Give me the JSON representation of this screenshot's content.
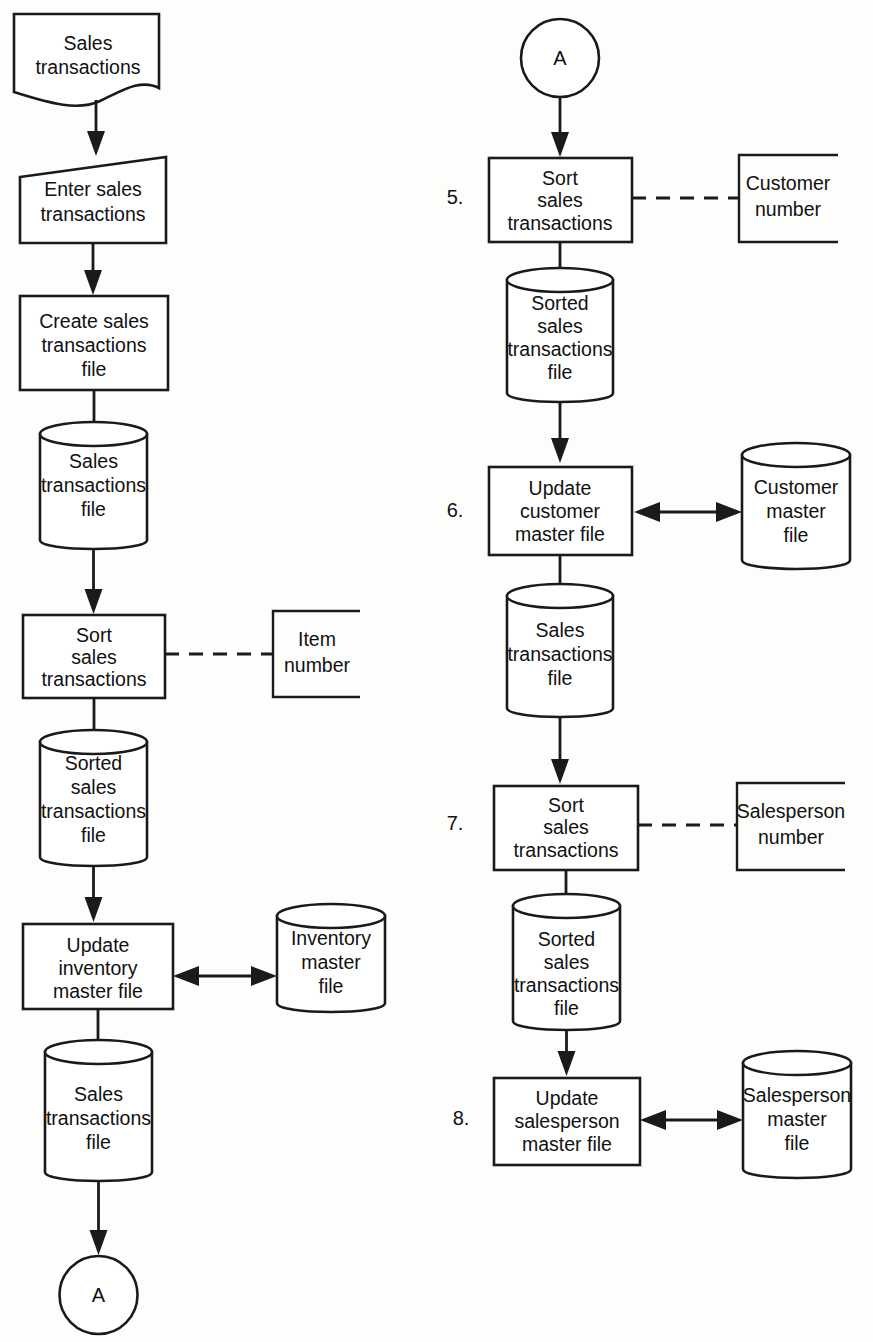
{
  "diagram": {
    "type": "system-flowchart",
    "colors": {
      "stroke": "#1a1a1a",
      "fill": "#ffffff",
      "background": "#fdfdfc",
      "text": "#111111"
    },
    "left_column": {
      "nodes": [
        {
          "id": "doc-sales-transactions",
          "shape": "document",
          "lines": [
            "Sales",
            "transactions"
          ]
        },
        {
          "id": "manual-enter-sales-transactions",
          "shape": "manual-input",
          "lines": [
            "Enter sales",
            "transactions"
          ]
        },
        {
          "id": "process-create-sales-transactions-file",
          "shape": "process",
          "lines": [
            "Create sales",
            "transactions",
            "file"
          ]
        },
        {
          "id": "store-sales-transactions-file-1",
          "shape": "cylinder",
          "lines": [
            "Sales",
            "transactions",
            "file"
          ]
        },
        {
          "id": "process-sort-sales-transactions-item",
          "shape": "process",
          "lines": [
            "Sort",
            "sales",
            "transactions"
          ]
        },
        {
          "id": "store-sorted-sales-transactions-file-1",
          "shape": "cylinder",
          "lines": [
            "Sorted",
            "sales",
            "transactions",
            "file"
          ]
        },
        {
          "id": "process-update-inventory-master-file",
          "shape": "process",
          "lines": [
            "Update",
            "inventory",
            "master file"
          ]
        },
        {
          "id": "store-sales-transactions-file-2",
          "shape": "cylinder",
          "lines": [
            "Sales",
            "transactions",
            "file"
          ]
        },
        {
          "id": "connector-a-out",
          "shape": "circle",
          "lines": [
            "A"
          ]
        }
      ],
      "annotations": [
        {
          "id": "annotation-item-number",
          "shape": "open-box",
          "lines": [
            "Item",
            "number"
          ],
          "attached_to": "process-sort-sales-transactions-item",
          "link": "dashed"
        }
      ],
      "master_files": [
        {
          "id": "store-inventory-master-file",
          "shape": "cylinder",
          "lines": [
            "Inventory",
            "master",
            "file"
          ],
          "link": "double-arrow",
          "linked_to": "process-update-inventory-master-file"
        }
      ]
    },
    "right_column": {
      "nodes": [
        {
          "id": "connector-a-in",
          "shape": "circle",
          "lines": [
            "A"
          ]
        },
        {
          "id": "process-sort-sales-transactions-customer",
          "shape": "process",
          "step": "5.",
          "lines": [
            "Sort",
            "sales",
            "transactions"
          ]
        },
        {
          "id": "store-sorted-sales-transactions-file-2",
          "shape": "cylinder",
          "lines": [
            "Sorted",
            "sales",
            "transactions",
            "file"
          ]
        },
        {
          "id": "process-update-customer-master-file",
          "shape": "process",
          "step": "6.",
          "lines": [
            "Update",
            "customer",
            "master file"
          ]
        },
        {
          "id": "store-sales-transactions-file-3",
          "shape": "cylinder",
          "lines": [
            "Sales",
            "transactions",
            "file"
          ]
        },
        {
          "id": "process-sort-sales-transactions-salesperson",
          "shape": "process",
          "step": "7.",
          "lines": [
            "Sort",
            "sales",
            "transactions"
          ]
        },
        {
          "id": "store-sorted-sales-transactions-file-3",
          "shape": "cylinder",
          "lines": [
            "Sorted",
            "sales",
            "transactions",
            "file"
          ]
        },
        {
          "id": "process-update-salesperson-master-file",
          "shape": "process",
          "step": "8.",
          "lines": [
            "Update",
            "salesperson",
            "master file"
          ]
        }
      ],
      "annotations": [
        {
          "id": "annotation-customer-number",
          "shape": "open-box",
          "lines": [
            "Customer",
            "number"
          ],
          "attached_to": "process-sort-sales-transactions-customer",
          "link": "dashed"
        },
        {
          "id": "annotation-salesperson-number",
          "shape": "open-box",
          "lines": [
            "Salesperson",
            "number"
          ],
          "attached_to": "process-sort-sales-transactions-salesperson",
          "link": "dashed"
        }
      ],
      "master_files": [
        {
          "id": "store-customer-master-file",
          "shape": "cylinder",
          "lines": [
            "Customer",
            "master",
            "file"
          ],
          "link": "double-arrow",
          "linked_to": "process-update-customer-master-file"
        },
        {
          "id": "store-salesperson-master-file",
          "shape": "cylinder",
          "lines": [
            "Salesperson",
            "master",
            "file"
          ],
          "link": "double-arrow",
          "linked_to": "process-update-salesperson-master-file"
        }
      ]
    },
    "step_numbers": [
      "5.",
      "6.",
      "7.",
      "8."
    ],
    "connector_letters": [
      "A",
      "A"
    ]
  },
  "text": {
    "sales": "Sales",
    "transactions": "transactions",
    "enter_sales": "Enter sales",
    "create_sales": "Create sales",
    "file": "file",
    "sort": "Sort",
    "sales_lower": "sales",
    "sorted": "Sorted",
    "update": "Update",
    "inventory": "inventory",
    "master_file": "master file",
    "master": "master",
    "item": "Item",
    "number": "number",
    "customer": "Customer",
    "customer_lower": "customer",
    "salesperson": "Salesperson",
    "salesperson_lower": "salesperson",
    "a": "A",
    "step5": "5.",
    "step6": "6.",
    "step7": "7.",
    "step8": "8."
  }
}
